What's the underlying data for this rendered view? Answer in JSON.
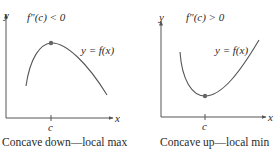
{
  "panels": [
    {
      "id": "left",
      "condition": "f″(c) < 0",
      "curve_label": "y = f(x)",
      "axis_x_label": "x",
      "axis_y_label": "y",
      "tick_label": "c",
      "caption": "Concave down—local max",
      "extremum": "local max"
    },
    {
      "id": "right",
      "condition": "f″(c) > 0",
      "curve_label": "y = f(x)",
      "axis_x_label": "x",
      "axis_y_label": "y",
      "tick_label": "c",
      "caption": "Concave up—local min",
      "extremum": "local min"
    }
  ],
  "colors": {
    "curve": "#555555",
    "axis": "#555555",
    "point": "#666666",
    "text": "#2a2a2a"
  }
}
